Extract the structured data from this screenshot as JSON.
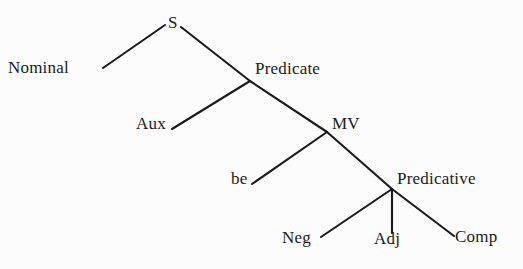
{
  "figure": {
    "kind": "syntax-tree-diagram",
    "background_color": "#fcfcfc",
    "ink_color": "#1a1a1a",
    "width": 523,
    "height": 269
  },
  "nodes": {
    "s": {
      "label": "S",
      "x": 168,
      "y": 14
    },
    "nominal": {
      "label": "Nominal",
      "x": 8,
      "y": 59
    },
    "predicate": {
      "label": "Predicate",
      "x": 255,
      "y": 60
    },
    "aux": {
      "label": "Aux",
      "x": 136,
      "y": 115
    },
    "mv": {
      "label": "MV",
      "x": 332,
      "y": 115
    },
    "be": {
      "label": "be",
      "x": 231,
      "y": 170
    },
    "predicative": {
      "label": "Predicative",
      "x": 397,
      "y": 170
    },
    "neg": {
      "label": "Neg",
      "x": 282,
      "y": 229
    },
    "adj": {
      "label": "Adj",
      "x": 374,
      "y": 230
    },
    "comp": {
      "label": "Comp",
      "x": 455,
      "y": 228
    }
  },
  "edges": [
    {
      "name": "edge-s-nominal",
      "from": "S",
      "to": "Nominal",
      "x1": 165,
      "y1": 25,
      "x2": 103,
      "y2": 68
    },
    {
      "name": "edge-s-predicate",
      "from": "S",
      "to": "Predicate",
      "x1": 181,
      "y1": 27,
      "x2": 250,
      "y2": 81
    },
    {
      "name": "edge-predicate-aux",
      "from": "Predicate",
      "to": "Aux",
      "x1": 250,
      "y1": 81,
      "x2": 172,
      "y2": 129
    },
    {
      "name": "edge-predicate-mv",
      "from": "Predicate",
      "to": "MV",
      "x1": 250,
      "y1": 81,
      "x2": 327,
      "y2": 132
    },
    {
      "name": "edge-mv-be",
      "from": "MV",
      "to": "be",
      "x1": 327,
      "y1": 132,
      "x2": 252,
      "y2": 184
    },
    {
      "name": "edge-mv-predicative",
      "from": "MV",
      "to": "Predicative",
      "x1": 327,
      "y1": 132,
      "x2": 392,
      "y2": 189
    },
    {
      "name": "edge-predicative-neg",
      "from": "Predicative",
      "to": "Neg",
      "x1": 392,
      "y1": 189,
      "x2": 321,
      "y2": 237
    },
    {
      "name": "edge-predicative-adj",
      "from": "Predicative",
      "to": "Adj",
      "x1": 392,
      "y1": 189,
      "x2": 392,
      "y2": 233
    },
    {
      "name": "edge-predicative-comp",
      "from": "Predicative",
      "to": "Comp",
      "x1": 392,
      "y1": 189,
      "x2": 454,
      "y2": 236
    }
  ]
}
